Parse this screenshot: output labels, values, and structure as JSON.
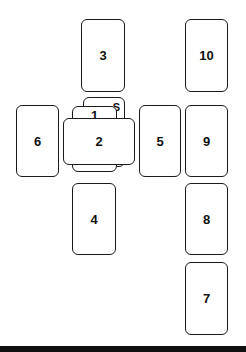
{
  "diagram": {
    "type": "tarot-spread-layout",
    "cards": [
      {
        "id": "s",
        "label": "S",
        "orientation": "vertical"
      },
      {
        "id": "1",
        "label": "1",
        "orientation": "vertical"
      },
      {
        "id": "2",
        "label": "2",
        "orientation": "horizontal"
      },
      {
        "id": "3",
        "label": "3",
        "orientation": "vertical"
      },
      {
        "id": "4",
        "label": "4",
        "orientation": "vertical"
      },
      {
        "id": "5",
        "label": "5",
        "orientation": "vertical"
      },
      {
        "id": "6",
        "label": "6",
        "orientation": "vertical"
      },
      {
        "id": "7",
        "label": "7",
        "orientation": "vertical"
      },
      {
        "id": "8",
        "label": "8",
        "orientation": "vertical"
      },
      {
        "id": "9",
        "label": "9",
        "orientation": "vertical"
      },
      {
        "id": "10",
        "label": "10",
        "orientation": "vertical"
      }
    ]
  },
  "colors": {
    "stroke": "#1a1a1a",
    "background": "#ffffff",
    "bar": "#111111"
  }
}
